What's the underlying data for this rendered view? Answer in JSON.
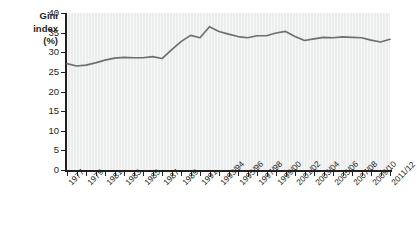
{
  "chart_data": {
    "type": "line",
    "title": "",
    "ylabel": "Gini index (%)",
    "ylabel_lines": [
      "Gini",
      "index",
      "(%)"
    ],
    "xlabel": "",
    "ylim": [
      0,
      40
    ],
    "yticks": [
      0,
      5,
      10,
      15,
      20,
      25,
      30,
      35,
      40
    ],
    "ytick_labels": [
      "0",
      "5",
      "10",
      "15",
      "20",
      "25",
      "30",
      "35",
      "40"
    ],
    "grid": false,
    "legend": "none",
    "line_color": "#6d6e71",
    "plot_background": "#eceded",
    "xtick_labels": [
      "1977",
      "1979",
      "1981",
      "1983",
      "1985",
      "1987",
      "1989",
      "1991",
      "1993/94",
      "1995/96",
      "1997/98",
      "1999/00",
      "2001/02",
      "2003/04",
      "2005/06",
      "2007/08",
      "2009/10",
      "2011/12"
    ],
    "categories": [
      "1977",
      "1978",
      "1979",
      "1980",
      "1981",
      "1982",
      "1983",
      "1984",
      "1985",
      "1986",
      "1987",
      "1988",
      "1989",
      "1990",
      "1991",
      "1992",
      "1993/94",
      "1994/95",
      "1995/96",
      "1996/97",
      "1997/98",
      "1998/99",
      "1999/00",
      "2000/01",
      "2001/02",
      "2002/03",
      "2003/04",
      "2004/05",
      "2005/06",
      "2006/07",
      "2007/08",
      "2008/09",
      "2009/10",
      "2010/11",
      "2011/12"
    ],
    "values": [
      27.1,
      26.5,
      26.7,
      27.3,
      28.0,
      28.5,
      28.7,
      28.6,
      28.6,
      28.9,
      28.4,
      30.6,
      32.7,
      34.3,
      33.7,
      36.5,
      35.3,
      34.6,
      34.0,
      33.7,
      34.2,
      34.2,
      34.9,
      35.3,
      34.0,
      33.0,
      33.4,
      33.8,
      33.7,
      33.9,
      33.8,
      33.7,
      33.1,
      32.6,
      33.3
    ]
  }
}
